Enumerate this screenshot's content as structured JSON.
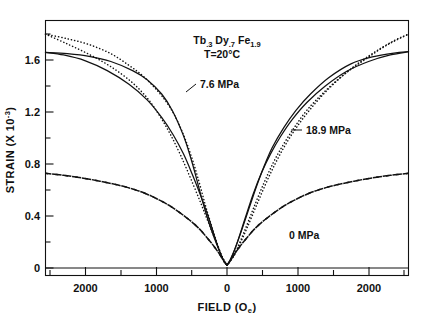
{
  "figure": {
    "caption_material": "Tb.3 Dy.7 Fe1.9",
    "material_parts": {
      "el1": "Tb",
      "sub1": ".3",
      "el2": "Dy",
      "sub2": ".7",
      "el3": "Fe",
      "sub3": "1.9"
    },
    "temperature": "T=20°C",
    "background": "#ffffff",
    "ink": "#111111"
  },
  "annotations": {
    "stress_low": "7.6 MPa",
    "stress_high": "18.9 MPa",
    "stress_zero": "0 MPa"
  },
  "axes": {
    "x": {
      "title": "FIELD (Oe)",
      "unit": "Oe",
      "tick_labels": [
        "2000",
        "1000",
        "0",
        "1000",
        "2000"
      ],
      "tick_values": [
        -2000,
        -1000,
        0,
        1000,
        2000
      ],
      "minor_step": 500,
      "range": [
        -2500,
        2500
      ]
    },
    "y": {
      "title": "STRAIN (X 10-3)",
      "title_main": "STRAIN (X 10",
      "title_exp": "-3",
      "title_tail": ")",
      "tick_labels": [
        "0",
        "0.4",
        "0.8",
        "1.2",
        "1.6"
      ],
      "tick_values": [
        0,
        0.4,
        0.8,
        1.2,
        1.6
      ],
      "minor_step": 0.2,
      "range": [
        -0.08,
        1.88
      ]
    }
  },
  "chart_data": {
    "type": "line",
    "xlabel": "FIELD (Oe)",
    "ylabel": "STRAIN (X 10-3)",
    "xlim": [
      -2500,
      2500
    ],
    "ylim": [
      -0.08,
      1.88
    ],
    "grid": false,
    "legend": "inline-annotations",
    "note": "Magnetostriction butterfly (strain vs applied field) hysteresis loops at three compressive prestress levels.",
    "series": [
      {
        "name": "7.6 MPa",
        "style": "solid",
        "branch_up": {
          "x": [
            -2500,
            -2200,
            -1900,
            -1600,
            -1300,
            -1100,
            -900,
            -750,
            -600,
            -500,
            -420,
            -340,
            -260,
            -180,
            -110,
            -60,
            -20,
            0
          ],
          "y": [
            1.635,
            1.625,
            1.605,
            1.565,
            1.495,
            1.425,
            1.315,
            1.185,
            0.995,
            0.825,
            0.665,
            0.495,
            0.345,
            0.215,
            0.115,
            0.05,
            0.012,
            0.0
          ]
        },
        "branch_down": {
          "x": [
            0,
            20,
            60,
            120,
            200,
            300,
            400,
            500,
            620,
            780,
            950,
            1150,
            1400,
            1700,
            2000,
            2300,
            2500
          ],
          "y": [
            0.0,
            0.015,
            0.06,
            0.14,
            0.265,
            0.43,
            0.595,
            0.745,
            0.9,
            1.055,
            1.19,
            1.315,
            1.44,
            1.545,
            1.6,
            1.63,
            1.64
          ]
        },
        "branch_up_right": {
          "x": [
            0,
            40,
            90,
            160,
            250,
            360,
            480,
            600,
            740,
            900,
            1100,
            1350,
            1650,
            1950,
            2250,
            2500
          ],
          "y": [
            0.0,
            0.03,
            0.095,
            0.205,
            0.36,
            0.545,
            0.715,
            0.855,
            0.99,
            1.12,
            1.25,
            1.375,
            1.49,
            1.565,
            1.615,
            1.64
          ]
        },
        "branch_down_left": {
          "x": [
            -2500,
            -2250,
            -1950,
            -1650,
            -1350,
            -1100,
            -900,
            -740,
            -600,
            -480,
            -360,
            -250,
            -160,
            -90,
            -40,
            0
          ],
          "y": [
            1.635,
            1.615,
            1.57,
            1.495,
            1.39,
            1.27,
            1.135,
            1.0,
            0.855,
            0.7,
            0.53,
            0.36,
            0.2,
            0.09,
            0.028,
            0.0
          ]
        }
      },
      {
        "name": "18.9 MPa",
        "style": "dotted",
        "branch_up": {
          "x": [
            -2500,
            -2200,
            -1900,
            -1600,
            -1350,
            -1150,
            -950,
            -800,
            -680,
            -570,
            -470,
            -380,
            -300,
            -220,
            -150,
            -90,
            -40,
            0
          ],
          "y": [
            1.775,
            1.74,
            1.695,
            1.625,
            1.535,
            1.45,
            1.335,
            1.225,
            1.105,
            0.96,
            0.8,
            0.63,
            0.465,
            0.315,
            0.19,
            0.09,
            0.025,
            0.0
          ]
        },
        "branch_down": {
          "x": [
            0,
            40,
            100,
            180,
            280,
            400,
            530,
            660,
            800,
            960,
            1150,
            1400,
            1700,
            2000,
            2300,
            2500
          ],
          "y": [
            0.0,
            0.025,
            0.075,
            0.165,
            0.29,
            0.45,
            0.62,
            0.775,
            0.92,
            1.06,
            1.2,
            1.355,
            1.505,
            1.625,
            1.725,
            1.775
          ]
        },
        "branch_up_right": {
          "x": [
            0,
            60,
            140,
            240,
            360,
            500,
            640,
            780,
            930,
            1100,
            1320,
            1600,
            1900,
            2200,
            2500
          ],
          "y": [
            0.0,
            0.05,
            0.13,
            0.26,
            0.43,
            0.62,
            0.79,
            0.93,
            1.06,
            1.19,
            1.32,
            1.46,
            1.58,
            1.69,
            1.775
          ]
        },
        "branch_down_left": {
          "x": [
            -2500,
            -2200,
            -1900,
            -1600,
            -1320,
            -1100,
            -930,
            -780,
            -640,
            -500,
            -360,
            -240,
            -140,
            -60,
            0
          ],
          "y": [
            1.775,
            1.7,
            1.62,
            1.525,
            1.41,
            1.285,
            1.15,
            1.005,
            0.845,
            0.665,
            0.475,
            0.305,
            0.165,
            0.06,
            0.0
          ]
        }
      },
      {
        "name": "0 MPa",
        "style": "dashed",
        "branch_up": {
          "x": [
            -2500,
            -2250,
            -2000,
            -1750,
            -1500,
            -1300,
            -1100,
            -950,
            -800,
            -680,
            -560,
            -450,
            -350,
            -260,
            -180,
            -110,
            -55,
            0
          ],
          "y": [
            0.705,
            0.69,
            0.67,
            0.645,
            0.615,
            0.585,
            0.545,
            0.505,
            0.46,
            0.415,
            0.365,
            0.315,
            0.26,
            0.2,
            0.145,
            0.09,
            0.04,
            0.0
          ]
        },
        "branch_down": {
          "x": [
            0,
            55,
            110,
            180,
            260,
            350,
            450,
            560,
            680,
            800,
            950,
            1100,
            1300,
            1500,
            1750,
            2000,
            2250,
            2500
          ],
          "y": [
            0.0,
            0.04,
            0.09,
            0.145,
            0.2,
            0.26,
            0.315,
            0.365,
            0.415,
            0.46,
            0.505,
            0.545,
            0.585,
            0.615,
            0.645,
            0.67,
            0.69,
            0.705
          ]
        }
      }
    ]
  }
}
